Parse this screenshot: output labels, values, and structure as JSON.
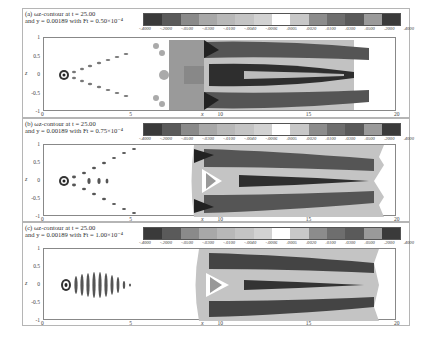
{
  "chart_data": [
    {
      "type": "heatmap",
      "subtype": "filled contour",
      "panel_label": "(a)",
      "title_line1": "(a) ωz-contour at t = 25.00",
      "title_line2": "and y = 0.00189 with Ft = 0.50×10⁻⁴",
      "xlabel": "x",
      "ylabel": "z",
      "xlim": [
        0,
        20
      ],
      "ylim": [
        -1,
        1
      ],
      "xticks": [
        "0",
        "5",
        "10",
        "15",
        "20"
      ],
      "yticks": [
        "1",
        "0.5",
        "0",
        "-0.5",
        "-1"
      ],
      "levels": [
        -0.4,
        -0.2,
        -0.05,
        -0.03,
        -0.01,
        -0.004,
        -0.0006,
        0.0005,
        0.002,
        0.01,
        0.03,
        0.05,
        0.2,
        0.4
      ],
      "description": "Small vortex packet near x=1, diverging wedge of structures to x~6, dense turbulent region x~8-12, streaky elongated structures to x~19"
    },
    {
      "type": "heatmap",
      "subtype": "filled contour",
      "panel_label": "(b)",
      "title_line1": "(b) ωz-contour at t = 25.00",
      "title_line2": "and y = 0.00189 with Ft = 0.75×10⁻⁴",
      "xlabel": "x",
      "ylabel": "z",
      "xlim": [
        0,
        20
      ],
      "ylim": [
        -1,
        1
      ],
      "xticks": [
        "0",
        "5",
        "10",
        "15",
        "20"
      ],
      "yticks": [
        "1",
        "0.5",
        "0",
        "-0.5",
        "-1"
      ],
      "levels": [
        -0.4,
        -0.2,
        -0.05,
        -0.03,
        -0.01,
        -0.004,
        -0.0006,
        0.0005,
        0.002,
        0.01,
        0.03,
        0.05,
        0.2,
        0.4
      ],
      "description": "Wedge of structures from x~1 spreading to z=±1 at x~6, turbulent spot x~8-19"
    },
    {
      "type": "heatmap",
      "subtype": "filled contour",
      "panel_label": "(c)",
      "title_line1": "(c) ωz-contour at t = 25.00",
      "title_line2": "and y = 0.00189 with Ft = 1.00×10⁻⁴",
      "xlabel": "x",
      "ylabel": "z",
      "xlim": [
        0,
        20
      ],
      "ylim": [
        -1,
        1
      ],
      "xticks": [
        "0",
        "5",
        "10",
        "15",
        "20"
      ],
      "yticks": [
        "1",
        "0.5",
        "0",
        "-0.5",
        "-1"
      ],
      "levels": [
        -0.4,
        -0.2,
        -0.05,
        -0.03,
        -0.01,
        -0.004,
        -0.0006,
        0.0005,
        0.002,
        0.01,
        0.03,
        0.05,
        0.2,
        0.4
      ],
      "description": "Compact packet x~1-4.5, turbulent spot x~8.5-18.5"
    }
  ],
  "colorbar": {
    "labels": [
      "-.4000",
      "-.2000",
      "-.0500",
      "-.0300",
      "-.0100",
      "-.0040",
      "-.0006",
      ".0005",
      ".0020",
      ".0100",
      ".0300",
      ".0500",
      ".2000",
      ".4000"
    ],
    "colors": [
      "#3a3a3a",
      "#5a5a5a",
      "#8a8a8a",
      "#a8a8a8",
      "#b8b8b8",
      "#c4c4c4",
      "#d2d2d2",
      "#ffffff",
      "#c8c8c8",
      "#8c8c8c",
      "#6e6e6e",
      "#5a5a5a",
      "#9a9a9a",
      "#3a3a3a"
    ]
  },
  "panels": [
    {
      "title_line1": "(a) ωz-contour at t = 25.00",
      "title_line2": "and y = 0.00189 with Ft = 0.50×10⁻⁴"
    },
    {
      "title_line1": "(b) ωz-contour at t = 25.00",
      "title_line2": "and y = 0.00189 with Ft = 0.75×10⁻⁴"
    },
    {
      "title_line1": "(c) ωz-contour at t = 25.00",
      "title_line2": "and y = 0.00189 with Ft = 1.00×10⁻⁴"
    }
  ],
  "axes": {
    "xlabel": "x",
    "ylabel": "z",
    "xticks": [
      "0",
      "5",
      "10",
      "15",
      "20"
    ],
    "yticks": [
      "1",
      "0.5",
      "0",
      "-0.5",
      "-1"
    ]
  }
}
